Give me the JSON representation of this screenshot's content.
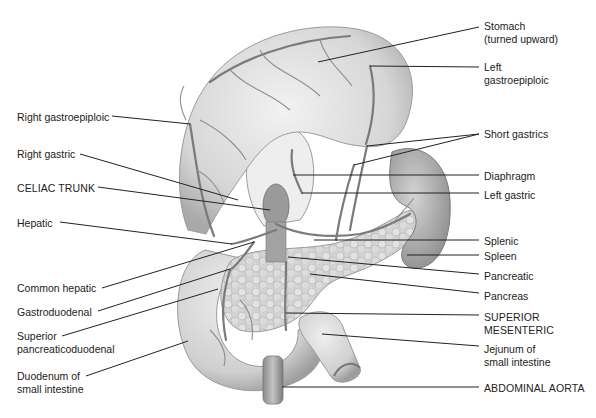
{
  "figure": {
    "colors": {
      "background": "#ffffff",
      "ink": "#222222",
      "organ_fill": "#d9d9d9",
      "organ_shade": "#a8a8a8",
      "vessel": "#7a7a7a"
    }
  },
  "labels": {
    "left": [
      {
        "id": "right-gastroepiploic",
        "text": "Right gastroepiploic",
        "x": 17,
        "y": 111,
        "line": [
          [
            112,
            116
          ],
          [
            190,
            124
          ]
        ]
      },
      {
        "id": "right-gastric",
        "text": "Right gastric",
        "x": 17,
        "y": 148,
        "line": [
          [
            80,
            154
          ],
          [
            238,
            200
          ]
        ]
      },
      {
        "id": "celiac-trunk",
        "text": "CELIAC TRUNK",
        "x": 17,
        "y": 182,
        "line": [
          [
            98,
            187
          ],
          [
            270,
            210
          ]
        ]
      },
      {
        "id": "hepatic",
        "text": "Hepatic",
        "x": 17,
        "y": 217,
        "line": [
          [
            60,
            222
          ],
          [
            232,
            244
          ]
        ]
      },
      {
        "id": "common-hepatic",
        "text": "Common hepatic",
        "x": 17,
        "y": 282,
        "line": [
          [
            102,
            288
          ],
          [
            254,
            242
          ]
        ]
      },
      {
        "id": "gastroduodenal",
        "text": "Gastroduodenal",
        "x": 17,
        "y": 306,
        "line": [
          [
            98,
            311
          ],
          [
            230,
            269
          ]
        ]
      },
      {
        "id": "superior-pancreaticoduodenal",
        "text": "Superior\npancreaticoduodenal",
        "x": 17,
        "y": 330,
        "line": [
          [
            62,
            336
          ],
          [
            218,
            289
          ]
        ]
      },
      {
        "id": "duodenum",
        "text": "Duodenum of\nsmall intestine",
        "x": 17,
        "y": 370,
        "line": [
          [
            86,
            376
          ],
          [
            188,
            341
          ]
        ]
      }
    ],
    "right": [
      {
        "id": "stomach",
        "text": "Stomach\n(turned upward)",
        "x": 484,
        "y": 20,
        "line": [
          [
            318,
            62
          ],
          [
            479,
            27
          ]
        ]
      },
      {
        "id": "left-gastroepiploic",
        "text": "Left\ngastroepiploic",
        "x": 484,
        "y": 61,
        "line": [
          [
            370,
            66
          ],
          [
            479,
            67
          ]
        ]
      },
      {
        "id": "short-gastrics",
        "text": "Short gastrics",
        "x": 484,
        "y": 128,
        "line": [
          [
            367,
            146
          ],
          [
            479,
            134
          ]
        ],
        "line2": [
          [
            354,
            165
          ],
          [
            479,
            134
          ]
        ]
      },
      {
        "id": "diaphragm",
        "text": "Diaphragm",
        "x": 484,
        "y": 170,
        "line": [
          [
            293,
            175
          ],
          [
            479,
            175
          ]
        ]
      },
      {
        "id": "left-gastric",
        "text": "Left gastric",
        "x": 484,
        "y": 189,
        "line": [
          [
            302,
            193
          ],
          [
            479,
            193
          ]
        ]
      },
      {
        "id": "splenic",
        "text": "Splenic",
        "x": 484,
        "y": 235,
        "line": [
          [
            314,
            240
          ],
          [
            479,
            240
          ]
        ]
      },
      {
        "id": "spleen",
        "text": "Spleen",
        "x": 484,
        "y": 250,
        "line": [
          [
            407,
            255
          ],
          [
            479,
            255
          ]
        ]
      },
      {
        "id": "pancreatic",
        "text": "Pancreatic",
        "x": 484,
        "y": 270,
        "line": [
          [
            288,
            257
          ],
          [
            479,
            274
          ]
        ]
      },
      {
        "id": "pancreas",
        "text": "Pancreas",
        "x": 484,
        "y": 290,
        "line": [
          [
            310,
            274
          ],
          [
            479,
            293
          ]
        ]
      },
      {
        "id": "superior-mesenteric",
        "text": "SUPERIOR\nMESENTERIC",
        "x": 484,
        "y": 311,
        "line": [
          [
            286,
            313
          ],
          [
            479,
            315
          ]
        ]
      },
      {
        "id": "jejunum",
        "text": "Jejunum of\nsmall intestine",
        "x": 484,
        "y": 343,
        "line": [
          [
            322,
            334
          ],
          [
            479,
            346
          ]
        ]
      },
      {
        "id": "abdominal-aorta",
        "text": "ABDOMINAL AORTA",
        "x": 484,
        "y": 382,
        "line": [
          [
            282,
            387
          ],
          [
            479,
            387
          ]
        ]
      }
    ]
  }
}
